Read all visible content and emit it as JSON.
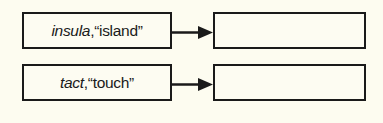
{
  "diagram": {
    "rows": [
      {
        "term": "insula",
        "separator": ",",
        "meaning": "“island”",
        "target": ""
      },
      {
        "term": "tact",
        "separator": ",",
        "meaning": "“touch”",
        "target": ""
      }
    ],
    "colors": {
      "stroke": "#1a1a1a",
      "background": "#fdfcf0"
    }
  }
}
